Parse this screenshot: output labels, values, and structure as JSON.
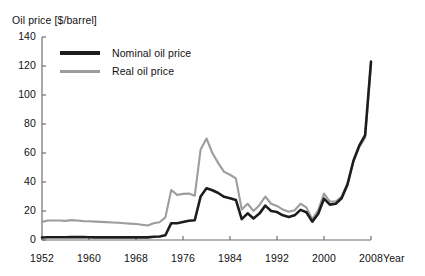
{
  "chart_data": {
    "type": "line",
    "title": "",
    "ylabel": "Oil price [$/barrel]",
    "xlabel": "Year",
    "ylim": [
      0,
      140
    ],
    "xlim": [
      1952,
      2008
    ],
    "yticks": [
      "0",
      "20",
      "40",
      "60",
      "80",
      "100",
      "120",
      "140"
    ],
    "xticks": [
      "1952",
      "1960",
      "1968",
      "1976",
      "1984",
      "1992",
      "2000",
      "2008"
    ],
    "grid": false,
    "legend_position": "upper-left",
    "colors": {
      "nominal": "#1d1d1d",
      "real": "#9d9d9d",
      "axis": "#6f6f6f"
    },
    "x": [
      1952,
      1953,
      1954,
      1955,
      1956,
      1957,
      1958,
      1959,
      1960,
      1961,
      1962,
      1963,
      1964,
      1965,
      1966,
      1967,
      1968,
      1969,
      1970,
      1971,
      1972,
      1973,
      1974,
      1975,
      1976,
      1977,
      1978,
      1979,
      1980,
      1981,
      1982,
      1983,
      1984,
      1985,
      1986,
      1987,
      1988,
      1989,
      1990,
      1991,
      1992,
      1993,
      1994,
      1995,
      1996,
      1997,
      1998,
      1999,
      2000,
      2001,
      2002,
      2003,
      2004,
      2005,
      2006,
      2007,
      2008
    ],
    "series": [
      {
        "name": "Nominal oil price",
        "values": [
          1.7,
          1.9,
          1.9,
          1.9,
          1.9,
          2.0,
          2.0,
          2.0,
          1.9,
          1.8,
          1.8,
          1.8,
          1.8,
          1.8,
          1.8,
          1.8,
          1.8,
          1.8,
          1.8,
          2.2,
          2.4,
          3.3,
          11.6,
          11.5,
          12.4,
          13.3,
          13.6,
          30.0,
          35.7,
          34.3,
          32.4,
          29.8,
          28.8,
          27.6,
          14.4,
          18.4,
          14.9,
          18.2,
          23.7,
          20.0,
          19.3,
          17.0,
          15.8,
          17.0,
          20.8,
          19.1,
          12.7,
          17.9,
          28.5,
          24.4,
          25.0,
          28.8,
          38.3,
          54.5,
          65.1,
          72.4,
          123.0
        ]
      },
      {
        "name": "Real oil price",
        "values": [
          12.5,
          13.5,
          13.4,
          13.4,
          13.2,
          13.7,
          13.4,
          13.0,
          12.9,
          12.7,
          12.5,
          12.3,
          12.1,
          11.9,
          11.6,
          11.3,
          11.0,
          10.5,
          10.0,
          11.6,
          12.2,
          15.6,
          34.5,
          31.1,
          31.8,
          32.0,
          30.5,
          62.5,
          70.0,
          60.0,
          53.0,
          47.0,
          45.0,
          42.5,
          21.0,
          25.0,
          20.0,
          24.0,
          30.0,
          25.0,
          23.5,
          21.0,
          19.5,
          20.5,
          25.0,
          22.5,
          14.5,
          20.5,
          32.0,
          26.5,
          26.5,
          30.0,
          39.0,
          54.0,
          64.0,
          70.5,
          122.0
        ]
      }
    ]
  },
  "legend": {
    "items": [
      {
        "label": "Nominal oil price",
        "style": "nominal"
      },
      {
        "label": "Real oil price",
        "style": "real"
      }
    ]
  }
}
